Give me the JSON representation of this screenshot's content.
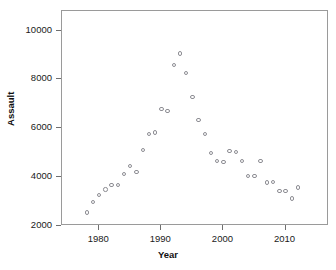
{
  "chart_data": {
    "type": "scatter",
    "title": "",
    "xlabel": "Year",
    "ylabel": "Assault",
    "xlim": [
      1974,
      2017
    ],
    "ylim": [
      2000,
      10800
    ],
    "grid": false,
    "legend": null,
    "x_ticks": [
      1980,
      1990,
      2000,
      2010
    ],
    "y_ticks": [
      2000,
      4000,
      6000,
      8000,
      10000
    ],
    "x_tick_labels": [
      "1980",
      "1990",
      "2000",
      "2010"
    ],
    "y_tick_labels": [
      "2000",
      "4000",
      "6000",
      "8000",
      "10000"
    ],
    "marker": "open-circle",
    "marker_color": "#8d8d93",
    "series": [
      {
        "name": "Assault",
        "x": [
          1978,
          1979,
          1980,
          1981,
          1982,
          1983,
          1984,
          1985,
          1986,
          1987,
          1988,
          1989,
          1990,
          1991,
          1992,
          1993,
          1994,
          1995,
          1996,
          1997,
          1998,
          1999,
          2000,
          2001,
          2002,
          2003,
          2004,
          2005,
          2006,
          2007,
          2008,
          2009,
          2010,
          2011,
          2012
        ],
        "y": [
          2560,
          2970,
          3270,
          3490,
          3680,
          3680,
          4120,
          4460,
          4200,
          5110,
          5760,
          5830,
          6790,
          6710,
          8600,
          9060,
          8250,
          7280,
          6350,
          5770,
          4980,
          4650,
          4630,
          5070,
          5020,
          4650,
          4050,
          4050,
          4660,
          3780,
          3790,
          3440,
          3440,
          3120,
          3580
        ]
      }
    ]
  },
  "axis": {
    "x_title": "Year",
    "y_title": "Assault"
  }
}
